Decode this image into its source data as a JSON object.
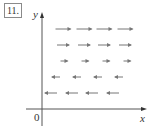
{
  "figure": {
    "label": "11.",
    "axes": {
      "x_label": "x",
      "y_label": "y",
      "origin_label": "0"
    },
    "colors": {
      "axis": "#555555",
      "arrow": "#777777",
      "text": "#333333"
    },
    "vector_field": {
      "rows": [
        {
          "y": 29,
          "direction": "right",
          "length": 15,
          "columns": [
            63,
            84,
            104,
            125
          ]
        },
        {
          "y": 45,
          "direction": "right",
          "length": 12,
          "columns": [
            63,
            84,
            104,
            125
          ]
        },
        {
          "y": 61,
          "direction": "right",
          "length": 7,
          "columns": [
            64,
            85,
            106,
            127
          ]
        },
        {
          "y": 77,
          "direction": "left",
          "length": 8,
          "columns": [
            56,
            77,
            98,
            119
          ]
        },
        {
          "y": 93,
          "direction": "left",
          "length": 12,
          "columns": [
            51,
            72,
            92,
            113
          ]
        }
      ]
    }
  }
}
